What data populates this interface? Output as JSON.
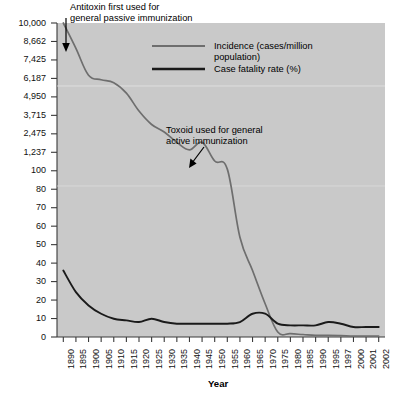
{
  "chart_data": {
    "type": "line",
    "title": "",
    "xlabel": "Year",
    "ylabel": "",
    "grid": false,
    "legend_position": "top-right",
    "background_color": "#c9c9c9",
    "x_tick_labels": [
      "1890",
      "1895",
      "1900",
      "1905",
      "1910",
      "1915",
      "1920",
      "1925",
      "1930",
      "1935",
      "1940",
      "1945",
      "1950",
      "1955",
      "1960",
      "1965",
      "1970",
      "1975",
      "1980",
      "1985",
      "1990",
      "1995",
      "1997",
      "2000",
      "2001",
      "2002"
    ],
    "y_tick_labels": [
      "10,000",
      "8,662",
      "7,425",
      "6,187",
      "4,950",
      "3,715",
      "2,475",
      "1,237",
      "100",
      "80",
      "70",
      "60",
      "50",
      "40",
      "30",
      "20",
      "10",
      "0"
    ],
    "y_tick_values": [
      10000,
      8662,
      7425,
      6187,
      4950,
      3715,
      2475,
      1237,
      100,
      80,
      70,
      60,
      50,
      40,
      30,
      20,
      10,
      0
    ],
    "y_axis_note": "Broken/compressed scale: upper section 1,237-10,000 (incidence), lower section 0-100 (case fatality rate)",
    "series": [
      {
        "name": "Incidence (cases/million population)",
        "color": "#666666",
        "x": [
          "1890",
          "1895",
          "1900",
          "1905",
          "1910",
          "1915",
          "1920",
          "1925",
          "1930",
          "1935",
          "1940",
          "1945",
          "1950",
          "1955",
          "1960",
          "1965",
          "1970",
          "1975",
          "1980",
          "1985",
          "1990",
          "1995",
          "1997",
          "2000",
          "2001",
          "2002"
        ],
        "values": [
          10000,
          8200,
          6400,
          6100,
          5900,
          5200,
          4000,
          3100,
          2600,
          1900,
          1400,
          1900,
          700,
          200,
          60,
          40,
          20,
          3,
          2,
          1.5,
          1,
          1,
          0.8,
          0.5,
          0.5,
          0.5
        ]
      },
      {
        "name": "Case fatality rate (%)",
        "color": "#1a1a1a",
        "x": [
          "1890",
          "1895",
          "1900",
          "1905",
          "1910",
          "1915",
          "1920",
          "1925",
          "1930",
          "1935",
          "1940",
          "1945",
          "1950",
          "1955",
          "1960",
          "1965",
          "1970",
          "1975",
          "1980",
          "1985",
          "1990",
          "1995",
          "1997",
          "2000",
          "2001",
          "2002"
        ],
        "values": [
          40,
          27,
          19,
          14,
          11,
          10,
          9,
          11,
          9,
          8,
          8,
          8,
          8,
          8,
          9,
          14,
          14,
          8,
          7,
          7,
          7,
          9,
          8,
          6,
          6,
          6
        ]
      }
    ],
    "annotations": [
      {
        "id": "antitoxin",
        "lines": [
          "Antitoxin first used for",
          "general passive immunization"
        ],
        "points_to_year": "1893",
        "arrow": "down"
      },
      {
        "id": "toxoid",
        "lines": [
          "Toxoid used for general",
          "active immunization"
        ],
        "points_to_year": "1945",
        "arrow": "down-left"
      }
    ]
  },
  "legend": {
    "items": [
      {
        "label_line1": "Incidence (cases/million",
        "label_line2": "population)",
        "color": "#6e6e6e"
      },
      {
        "label_line1": "Case fatality rate (%)",
        "label_line2": "",
        "color": "#1a1a1a"
      }
    ]
  },
  "axis": {
    "x_title": "Year"
  }
}
